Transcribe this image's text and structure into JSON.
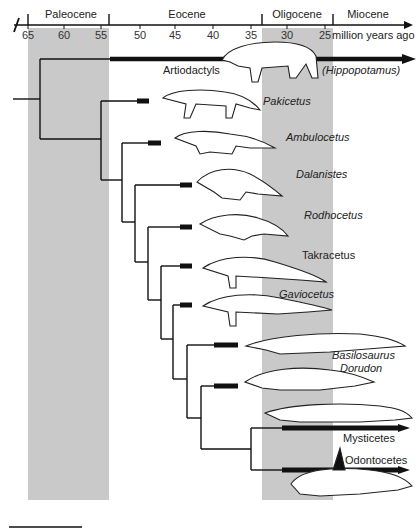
{
  "timescale": {
    "unit_label": "million years ago",
    "ticks": [
      "65",
      "60",
      "55",
      "50",
      "45",
      "40",
      "35",
      "30",
      "25"
    ],
    "periods": [
      {
        "name": "Paleocene"
      },
      {
        "name": "Eocene"
      },
      {
        "name": "Oligocene"
      },
      {
        "name": "Miocene"
      }
    ]
  },
  "taxa": [
    {
      "name": "Artiodactyls",
      "note": "(Hippopotamus)"
    },
    {
      "name": "Pakicetus"
    },
    {
      "name": "Ambulocetus"
    },
    {
      "name": "Dalanistes"
    },
    {
      "name": "Rodhocetus"
    },
    {
      "name": "Takracetus"
    },
    {
      "name": "Gaviocetus"
    },
    {
      "name": "Basilosaurus"
    },
    {
      "name": "Dorudon"
    },
    {
      "name": "Mysticetes"
    },
    {
      "name": "Odontocetes"
    }
  ],
  "colors": {
    "band": "#c8c8c8",
    "line": "#111111"
  }
}
